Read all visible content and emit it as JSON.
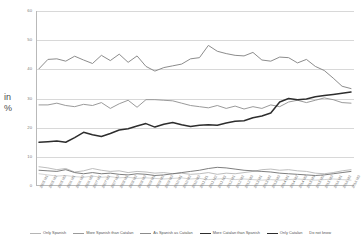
{
  "axis_label": {
    "line1": "in",
    "line2": "%"
  },
  "chart_data": {
    "type": "line",
    "title": "",
    "subtitle": "",
    "xlabel": "",
    "ylabel": "in %",
    "ylim": [
      0,
      60
    ],
    "yticks": [
      0,
      10,
      20,
      30,
      40,
      50,
      60
    ],
    "grid": true,
    "legend_position": "bottom",
    "categories": [
      "2005 M1",
      "2005 M2",
      "2005 M3",
      "2006 M1",
      "2006 M2",
      "2006 M3",
      "2007 M1",
      "2007 M2",
      "2007 M3",
      "2008 M1",
      "2008 M2",
      "2008 M3",
      "2009 M1",
      "2009 M2",
      "2009 M3",
      "2010 M1",
      "2010 M2",
      "2010 M3",
      "2011 M1",
      "2011 M2",
      "2011 M3",
      "2012 M1",
      "2012 M2",
      "2012 M3",
      "2013 M1",
      "2013 M2",
      "2013 M3",
      "2014 M1",
      "2014 M2",
      "2014 M3",
      "2015 M1",
      "2015 M2",
      "2015 M3",
      "2016 M1",
      "2016 M2",
      "2016 M3"
    ],
    "series": [
      {
        "name": "As Spanish as Catalan",
        "color": "#8c8c8c",
        "width": 1.0,
        "values": [
          40.2,
          43.4,
          43.6,
          42.8,
          44.5,
          43.2,
          42.0,
          44.8,
          43.0,
          45.2,
          42.4,
          44.6,
          41.0,
          39.4,
          40.6,
          41.2,
          41.8,
          43.6,
          44.0,
          48.2,
          46.2,
          45.4,
          44.8,
          44.6,
          45.8,
          43.2,
          42.8,
          44.2,
          44.0,
          42.2,
          43.4,
          41.0,
          39.6,
          37.0,
          34.2,
          33.4
        ]
      },
      {
        "name": "More Spanish than Catalan",
        "color": "#9a9a9a",
        "width": 1.0,
        "values": [
          27.8,
          27.8,
          28.4,
          27.6,
          27.2,
          28.0,
          27.6,
          28.6,
          26.6,
          28.2,
          29.4,
          27.0,
          29.6,
          29.6,
          29.4,
          29.2,
          28.4,
          27.6,
          27.2,
          26.8,
          27.6,
          26.6,
          27.4,
          26.4,
          27.2,
          26.6,
          27.8,
          27.2,
          28.8,
          29.4,
          28.6,
          29.4,
          30.2,
          29.6,
          28.6,
          28.4
        ]
      },
      {
        "name": "More Catalan than Spanish",
        "color": "#2d2d2d",
        "width": 1.5,
        "values": [
          15.0,
          15.2,
          15.4,
          15.0,
          16.6,
          18.4,
          17.6,
          17.0,
          18.0,
          19.2,
          19.6,
          20.6,
          21.4,
          20.2,
          21.2,
          21.8,
          21.0,
          20.4,
          20.8,
          21.0,
          20.8,
          21.6,
          22.2,
          22.4,
          23.4,
          24.0,
          25.0,
          28.8,
          30.0,
          29.6,
          29.8,
          30.6,
          31.0,
          31.4,
          31.8,
          32.2
        ]
      },
      {
        "name": "Only Spanish",
        "color": "#b5b5b5",
        "width": 0.9,
        "values": [
          6.6,
          6.2,
          5.6,
          6.0,
          4.8,
          5.2,
          6.0,
          5.4,
          5.0,
          5.2,
          4.6,
          5.0,
          4.8,
          4.4,
          4.6,
          4.2,
          4.4,
          4.0,
          4.2,
          4.6,
          4.0,
          4.4,
          4.2,
          4.6,
          5.0,
          5.6,
          5.8,
          5.4,
          5.6,
          5.2,
          5.0,
          4.4,
          4.2,
          4.6,
          5.2,
          5.6
        ]
      },
      {
        "name": "Only Catalan",
        "color": "#6f6f6f",
        "width": 0.9,
        "values": [
          5.4,
          5.2,
          5.0,
          5.6,
          4.6,
          4.2,
          4.6,
          4.2,
          4.4,
          4.0,
          3.8,
          4.2,
          4.0,
          3.6,
          3.8,
          4.2,
          4.6,
          5.0,
          5.4,
          6.0,
          6.4,
          6.2,
          5.8,
          5.4,
          5.2,
          5.0,
          4.8,
          4.4,
          4.2,
          4.0,
          3.8,
          3.6,
          3.8,
          4.2,
          4.6,
          5.0
        ]
      },
      {
        "name": "Do not know",
        "color": "#c9c9c9",
        "width": 0.8,
        "values": [
          4.2,
          3.8,
          3.4,
          3.6,
          3.2,
          3.0,
          3.4,
          3.0,
          3.2,
          2.8,
          3.0,
          2.6,
          2.8,
          2.6,
          2.4,
          2.6,
          2.8,
          2.4,
          2.6,
          2.2,
          2.4,
          2.6,
          2.2,
          2.4,
          2.2,
          2.0,
          2.2,
          2.0,
          2.2,
          2.4,
          2.2,
          2.0,
          2.2,
          2.4,
          2.2,
          2.0
        ]
      }
    ],
    "legend_entries": [
      {
        "label": "Only Spanish",
        "color": "#b5b5b5",
        "width": 0.9,
        "marker": true
      },
      {
        "label": "More Spanish than Catalan",
        "color": "#9a9a9a",
        "width": 1.0,
        "marker": true
      },
      {
        "label": "As Spanish as Catalan",
        "color": "#8c8c8c",
        "width": 1.0,
        "marker": true
      },
      {
        "label": "More Catalan than Spanish",
        "color": "#2d2d2d",
        "width": 1.5,
        "marker": true
      },
      {
        "label": "Only Catalan",
        "color": "#2d2d2d",
        "width": 1.5,
        "marker": true
      },
      {
        "label": "Do not know",
        "color": "#c9c9c9",
        "width": 0.8,
        "marker": false
      }
    ]
  }
}
